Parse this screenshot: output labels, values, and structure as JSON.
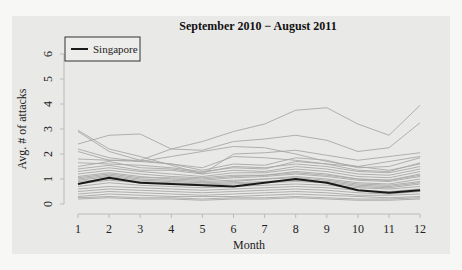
{
  "chart_data": {
    "type": "line",
    "title": "September 2010 − August 2011",
    "xlabel": "Month",
    "ylabel": "Avg. # of attacks",
    "x": [
      1,
      2,
      3,
      4,
      5,
      6,
      7,
      8,
      9,
      10,
      11,
      12
    ],
    "x_tick_labels": [
      "1",
      "2",
      "3",
      "4",
      "5",
      "6",
      "7",
      "8",
      "9",
      "10",
      "11",
      "12"
    ],
    "y_ticks": [
      0,
      1,
      2,
      3,
      4,
      5,
      6
    ],
    "y_tick_labels": [
      "0",
      "1",
      "2",
      "3",
      "4",
      "5",
      "6"
    ],
    "ylim": [
      0,
      6.2
    ],
    "xlim": [
      0.9,
      12.1
    ],
    "grid": false,
    "legend": {
      "position": "top-left",
      "entries": [
        {
          "label": "Singapore",
          "color": "#1a1a1a"
        }
      ]
    },
    "highlight_series": {
      "name": "Singapore",
      "color": "#1a1a1a",
      "values": [
        0.8,
        1.05,
        0.85,
        0.8,
        0.75,
        0.7,
        0.85,
        1.0,
        0.85,
        0.55,
        0.45,
        0.55
      ]
    },
    "background_series_color": "#a8a8a8",
    "background_series": [
      {
        "values": [
          2.9,
          2.1,
          1.75,
          2.2,
          2.5,
          2.9,
          3.2,
          3.75,
          3.85,
          3.2,
          2.75,
          3.95
        ]
      },
      {
        "values": [
          2.4,
          2.75,
          2.8,
          2.2,
          2.15,
          2.5,
          2.6,
          2.75,
          2.55,
          2.1,
          2.25,
          3.25
        ]
      },
      {
        "values": [
          2.95,
          2.2,
          1.9,
          1.55,
          1.2,
          2.0,
          2.05,
          2.15,
          1.95,
          1.75,
          1.9,
          2.05
        ]
      },
      {
        "values": [
          2.1,
          1.75,
          1.7,
          1.9,
          2.1,
          2.3,
          2.25,
          2.0,
          1.7,
          1.5,
          1.35,
          1.6
        ]
      },
      {
        "values": [
          2.2,
          1.85,
          1.7,
          1.6,
          1.45,
          1.9,
          1.85,
          1.75,
          1.6,
          1.5,
          1.7,
          1.9
        ]
      },
      {
        "values": [
          1.8,
          1.75,
          1.75,
          1.6,
          1.35,
          1.6,
          1.55,
          1.85,
          1.75,
          1.45,
          1.5,
          1.85
        ]
      },
      {
        "values": [
          1.65,
          1.6,
          1.55,
          1.45,
          1.3,
          1.45,
          1.4,
          1.7,
          1.6,
          1.35,
          1.3,
          1.65
        ]
      },
      {
        "values": [
          1.5,
          1.7,
          1.45,
          1.4,
          1.25,
          1.5,
          1.45,
          1.6,
          1.5,
          1.3,
          1.25,
          1.5
        ]
      },
      {
        "values": [
          1.4,
          1.55,
          1.35,
          1.35,
          1.2,
          1.35,
          1.3,
          1.5,
          1.4,
          1.2,
          1.15,
          1.4
        ]
      },
      {
        "values": [
          1.3,
          1.45,
          1.3,
          1.2,
          1.1,
          1.25,
          1.25,
          1.4,
          1.3,
          1.1,
          1.05,
          1.3
        ]
      },
      {
        "values": [
          1.2,
          1.35,
          1.2,
          1.1,
          1.05,
          1.15,
          1.15,
          1.3,
          1.2,
          1.0,
          0.95,
          1.2
        ]
      },
      {
        "values": [
          1.1,
          1.25,
          1.1,
          1.0,
          0.95,
          1.05,
          1.1,
          1.2,
          1.1,
          0.95,
          0.9,
          1.1
        ]
      },
      {
        "values": [
          1.0,
          1.15,
          1.0,
          0.95,
          0.9,
          0.95,
          1.0,
          1.1,
          1.0,
          0.85,
          0.8,
          1.0
        ]
      },
      {
        "values": [
          0.9,
          1.0,
          0.9,
          0.85,
          0.8,
          0.85,
          0.9,
          0.95,
          0.9,
          0.75,
          0.7,
          0.85
        ]
      },
      {
        "values": [
          0.7,
          0.85,
          0.75,
          0.7,
          0.65,
          0.7,
          0.75,
          0.8,
          0.75,
          0.65,
          0.6,
          0.7
        ]
      },
      {
        "values": [
          0.6,
          0.7,
          0.65,
          0.6,
          0.55,
          0.6,
          0.65,
          0.7,
          0.65,
          0.55,
          0.5,
          0.6
        ]
      },
      {
        "values": [
          0.5,
          0.6,
          0.55,
          0.5,
          0.45,
          0.5,
          0.55,
          0.6,
          0.55,
          0.45,
          0.4,
          0.5
        ]
      },
      {
        "values": [
          0.4,
          0.5,
          0.45,
          0.4,
          0.35,
          0.4,
          0.45,
          0.5,
          0.45,
          0.35,
          0.35,
          0.4
        ]
      },
      {
        "values": [
          0.3,
          0.4,
          0.35,
          0.3,
          0.3,
          0.3,
          0.35,
          0.4,
          0.35,
          0.3,
          0.25,
          0.3
        ]
      },
      {
        "values": [
          0.25,
          0.3,
          0.25,
          0.25,
          0.2,
          0.25,
          0.25,
          0.3,
          0.25,
          0.2,
          0.2,
          0.25
        ]
      },
      {
        "values": [
          0.2,
          0.25,
          0.2,
          0.2,
          0.15,
          0.2,
          0.2,
          0.25,
          0.2,
          0.15,
          0.15,
          0.2
        ]
      },
      {
        "values": [
          1.05,
          1.2,
          1.05,
          1.05,
          1.0,
          1.1,
          1.15,
          1.25,
          1.15,
          1.0,
          0.95,
          1.15
        ]
      },
      {
        "values": [
          0.95,
          1.1,
          0.95,
          0.9,
          0.85,
          0.9,
          1.0,
          1.05,
          0.95,
          0.8,
          0.75,
          0.9
        ]
      },
      {
        "values": [
          0.8,
          0.95,
          0.85,
          0.8,
          0.75,
          0.8,
          0.85,
          0.9,
          0.85,
          0.7,
          0.65,
          0.8
        ]
      }
    ]
  }
}
